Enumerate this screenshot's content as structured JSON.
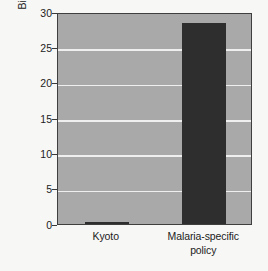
{
  "chart_data": {
    "type": "bar",
    "title": "",
    "subtitle": "",
    "xlabel": "",
    "ylabel": "Billion malaria infections avoided",
    "categories": [
      "Kyoto",
      "Malaria-specific policy"
    ],
    "values": [
      0.2,
      28.4
    ],
    "ylim": [
      0,
      30
    ],
    "yticks": [
      0,
      5,
      10,
      15,
      20,
      25,
      30
    ],
    "ytick_labels": [
      "0",
      "5",
      "10",
      "15",
      "20",
      "25",
      "30"
    ],
    "grid": "horizontal",
    "legend": "none",
    "annotations": [],
    "colors": {
      "bar": "#2e2e2e",
      "plot_background": "#a9a9a9",
      "gridline": "#efefef",
      "axis": "#3f3f3f",
      "page_background": "#f7f7f5",
      "text": "#1c1c1c"
    }
  },
  "axis": {
    "y_title": "Billion malaria infections avoided",
    "y_ticks": [
      {
        "label": "30",
        "value": 30
      },
      {
        "label": "25",
        "value": 25
      },
      {
        "label": "20",
        "value": 20
      },
      {
        "label": "15",
        "value": 15
      },
      {
        "label": "10",
        "value": 10
      },
      {
        "label": "5",
        "value": 5
      },
      {
        "label": "0",
        "value": 0
      }
    ],
    "x_categories": [
      {
        "line1": "Kyoto",
        "line2": ""
      },
      {
        "line1": "Malaria-specific",
        "line2": "policy"
      }
    ]
  }
}
